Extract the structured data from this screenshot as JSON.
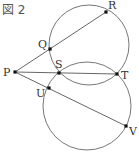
{
  "title": "図 2",
  "colors": {
    "line": "#555555",
    "circle": "#666666",
    "point": "#111111",
    "label": "#333333"
  },
  "circles": [
    {
      "name": "upper-circle",
      "cx": 89,
      "cy": 45,
      "r": 40
    },
    {
      "name": "lower-circle",
      "cx": 87,
      "cy": 106,
      "r": 44
    }
  ],
  "points": [
    {
      "id": "P",
      "label": "P",
      "x": 15,
      "y": 72,
      "lx": 3,
      "ly": 76
    },
    {
      "id": "Q",
      "label": "Q",
      "x": 50,
      "y": 49,
      "lx": 38,
      "ly": 48
    },
    {
      "id": "R",
      "label": "R",
      "x": 106,
      "y": 12,
      "lx": 108,
      "ly": 9
    },
    {
      "id": "S",
      "label": "S",
      "x": 59,
      "y": 73,
      "lx": 55,
      "ly": 68
    },
    {
      "id": "T",
      "label": "T",
      "x": 117,
      "y": 74,
      "lx": 121,
      "ly": 79
    },
    {
      "id": "U",
      "label": "U",
      "x": 49,
      "y": 88,
      "lx": 36,
      "ly": 97
    },
    {
      "id": "V",
      "label": "V",
      "x": 126,
      "y": 126,
      "lx": 129,
      "ly": 135
    }
  ],
  "segments": [
    {
      "name": "line-PR",
      "from": "P",
      "to": "R"
    },
    {
      "name": "line-PT",
      "from": "P",
      "to": "T"
    },
    {
      "name": "line-PV",
      "from": "P",
      "to": "V"
    }
  ]
}
